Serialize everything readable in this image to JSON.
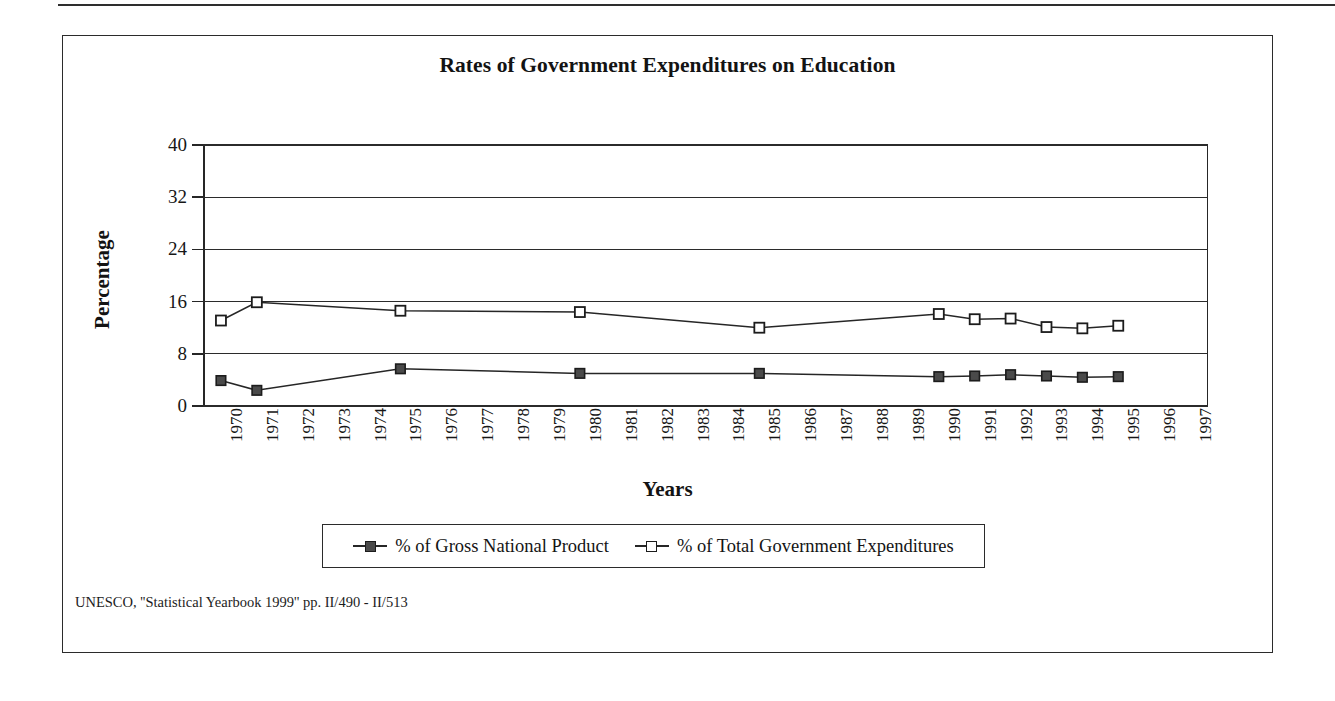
{
  "figure": {
    "title": "Rates of Government Expenditures on Education",
    "source_note": "UNESCO, ''Statistical Yearbook 1999'' pp. II/490 - II/513"
  },
  "chart_data": {
    "type": "line",
    "title": "Rates of Government Expenditures on Education",
    "xlabel": "Years",
    "ylabel": "Percentage",
    "ylim": [
      0,
      40
    ],
    "yticks": [
      0,
      8,
      16,
      24,
      32,
      40
    ],
    "grid": true,
    "legend_position": "bottom",
    "categories": [
      "1970",
      "1971",
      "1972",
      "1973",
      "1974",
      "1975",
      "1976",
      "1977",
      "1978",
      "1979",
      "1980",
      "1981",
      "1982",
      "1983",
      "1984",
      "1985",
      "1986",
      "1987",
      "1988",
      "1989",
      "1990",
      "1991",
      "1992",
      "1993",
      "1994",
      "1995",
      "1996",
      "1997"
    ],
    "series": [
      {
        "name": "% of Gross National Product",
        "marker": "filled-square",
        "points": [
          {
            "x": "1970",
            "y": 3.9
          },
          {
            "x": "1971",
            "y": 2.4
          },
          {
            "x": "1975",
            "y": 5.7
          },
          {
            "x": "1980",
            "y": 5.0
          },
          {
            "x": "1985",
            "y": 5.0
          },
          {
            "x": "1990",
            "y": 4.5
          },
          {
            "x": "1991",
            "y": 4.6
          },
          {
            "x": "1992",
            "y": 4.8
          },
          {
            "x": "1993",
            "y": 4.6
          },
          {
            "x": "1994",
            "y": 4.4
          },
          {
            "x": "1995",
            "y": 4.5
          }
        ]
      },
      {
        "name": "% of Total Government Expenditures",
        "marker": "open-square",
        "points": [
          {
            "x": "1970",
            "y": 13.1
          },
          {
            "x": "1971",
            "y": 15.9
          },
          {
            "x": "1975",
            "y": 14.6
          },
          {
            "x": "1980",
            "y": 14.4
          },
          {
            "x": "1985",
            "y": 12.0
          },
          {
            "x": "1990",
            "y": 14.1
          },
          {
            "x": "1991",
            "y": 13.3
          },
          {
            "x": "1992",
            "y": 13.4
          },
          {
            "x": "1993",
            "y": 12.1
          },
          {
            "x": "1994",
            "y": 11.9
          },
          {
            "x": "1995",
            "y": 12.3
          }
        ]
      }
    ]
  },
  "legend": {
    "entries": [
      {
        "label": "% of Gross National Product",
        "marker": "filled-square"
      },
      {
        "label": "% of Total Government Expenditures",
        "marker": "open-square"
      }
    ]
  },
  "colors": {
    "ink": "#262626",
    "marker_fill": "#4a4a4a",
    "background": "#ffffff"
  }
}
